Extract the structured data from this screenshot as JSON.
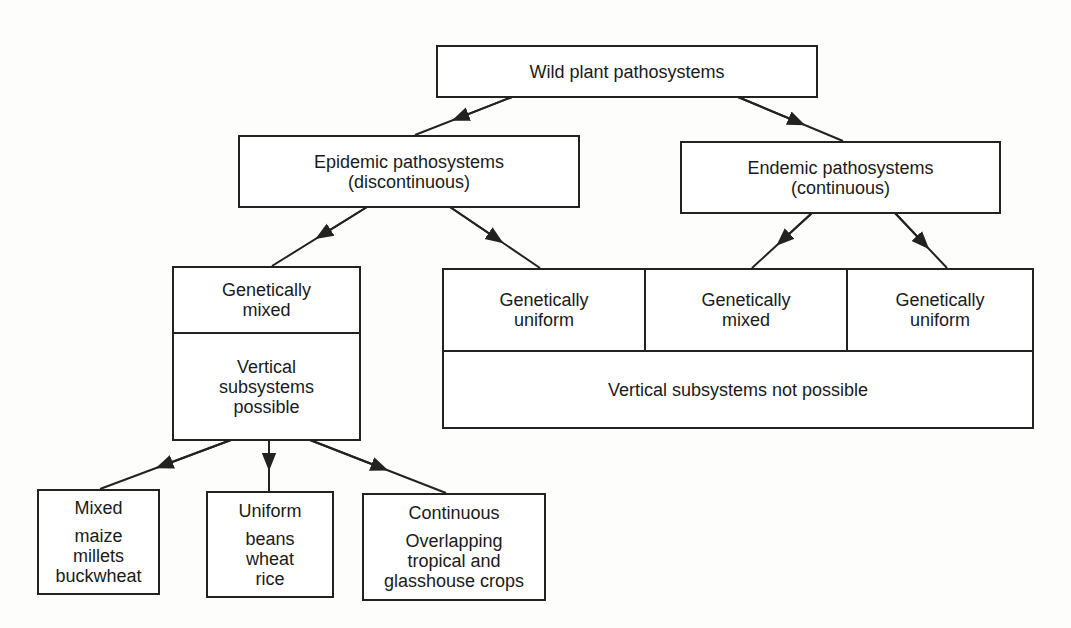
{
  "diagram": {
    "root": {
      "label": "Wild plant pathosystems"
    },
    "epidemic": {
      "title": "Epidemic pathosystems",
      "subtitle": "(discontinuous)"
    },
    "endemic": {
      "title": "Endemic pathosystems",
      "subtitle": "(continuous)"
    },
    "epidemic_mixed": {
      "top": [
        "Genetically",
        "mixed"
      ],
      "bottom": [
        "Vertical",
        "subsystems",
        "possible"
      ]
    },
    "non_vertical_group": {
      "cells": [
        {
          "lines": [
            "Genetically",
            "uniform"
          ]
        },
        {
          "lines": [
            "Genetically",
            "mixed"
          ]
        },
        {
          "lines": [
            "Genetically",
            "uniform"
          ]
        }
      ],
      "footer": "Vertical subsystems not possible"
    },
    "leaves": [
      {
        "heading": "Mixed",
        "lines": [
          "maize",
          "millets",
          "buckwheat"
        ]
      },
      {
        "heading": "Uniform",
        "lines": [
          "beans",
          "wheat",
          "rice"
        ]
      },
      {
        "heading": "Continuous",
        "lines": [
          "Overlapping",
          "tropical and",
          "glasshouse crops"
        ]
      }
    ],
    "edges": [
      {
        "from": "Wild plant pathosystems",
        "to": "Epidemic pathosystems"
      },
      {
        "from": "Wild plant pathosystems",
        "to": "Endemic pathosystems"
      },
      {
        "from": "Epidemic pathosystems",
        "to": "Genetically mixed (vertical subsystems possible)"
      },
      {
        "from": "Epidemic pathosystems",
        "to": "Genetically uniform (vertical subsystems not possible)"
      },
      {
        "from": "Endemic pathosystems",
        "to": "Genetically mixed (vertical subsystems not possible)"
      },
      {
        "from": "Endemic pathosystems",
        "to": "Genetically uniform (vertical subsystems not possible)"
      },
      {
        "from": "Vertical subsystems possible",
        "to": "Mixed"
      },
      {
        "from": "Vertical subsystems possible",
        "to": "Uniform"
      },
      {
        "from": "Vertical subsystems possible",
        "to": "Continuous"
      }
    ],
    "colors": {
      "stroke": "#222222",
      "background": "#ffffff",
      "text": "#1a1a1a"
    }
  }
}
